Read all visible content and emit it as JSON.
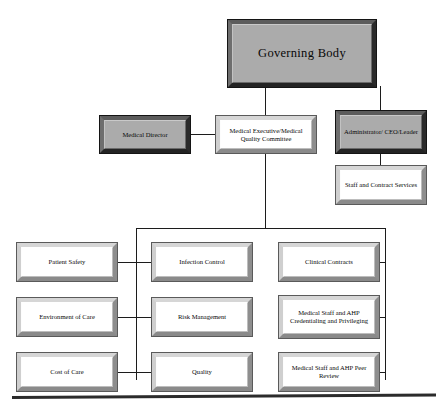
{
  "diagram": {
    "type": "org-chart",
    "colors": {
      "shaded_fill": "#a9a9a9",
      "plain_fill": "#ffffff",
      "line": "#1c1c1c",
      "frame_dark": "#232323",
      "frame_light": "#cfcfcf",
      "text": "#080808",
      "background": "#ffffff"
    },
    "nodes": {
      "governing_body": "Governing Body",
      "medical_director": "Medical Director",
      "medical_executive": "Medical Executive/Medical Quality Committee",
      "administrator": "Administrator/ CEO/Leader",
      "staff_contract": "Staff and Contract Services",
      "patient_safety": "Patient Safety",
      "environment_of_care": "Environment of Care",
      "cost_of_care": "Cost of Care",
      "infection_control": "Infection Control",
      "risk_management": "Risk Management",
      "quality": "Quality",
      "clinical_contracts": "Clinical Contracts",
      "credentialing": "Medical Staff and AHP Credentialing and Privileging",
      "peer_review": "Medical Staff and AHP Peer Review"
    }
  }
}
